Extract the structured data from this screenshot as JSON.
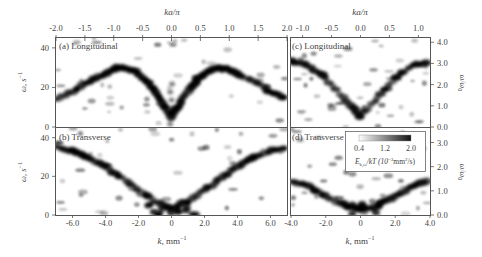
{
  "chart_data": [
    {
      "id": "a",
      "type": "heatmap",
      "title": "(a) Longitudinal",
      "xlabel": "k, mm^-1",
      "x2label": "ka/π",
      "ylabel": "ω, s^-1",
      "xlim": [
        -7.0,
        7.0
      ],
      "x2lim": [
        -2.0,
        2.0
      ],
      "ylim": [
        0,
        45
      ],
      "x2ticks": [
        "-2.0",
        "-1.5",
        "-1.0",
        "-0.5",
        "0.0",
        "0.5",
        "1.0",
        "1.5",
        "2.0"
      ],
      "yticks": [
        "0",
        "20",
        "40"
      ],
      "ridge": {
        "x": [
          -7.0,
          -6.0,
          -5.0,
          -4.0,
          -3.5,
          -3.0,
          -2.5,
          -2.0,
          -1.5,
          -1.0,
          -0.5,
          0.0,
          0.5,
          1.0,
          1.5,
          2.0,
          2.5,
          3.0,
          3.5,
          4.0,
          5.0,
          6.0,
          7.0
        ],
        "y": [
          14,
          18,
          23,
          27,
          29,
          30,
          29,
          27,
          23,
          18,
          12,
          5,
          12,
          18,
          23,
          27,
          29,
          30,
          29,
          27,
          23,
          18,
          14
        ]
      }
    },
    {
      "id": "b",
      "type": "heatmap",
      "title": "(b) Transverse",
      "xlabel": "k, mm^-1",
      "ylabel": "ω, s^-1",
      "xlim": [
        -7.0,
        7.0
      ],
      "ylim": [
        0,
        45
      ],
      "xticks": [
        "-6.0",
        "-4.0",
        "-2.0",
        "0",
        "2.0",
        "4.0",
        "6.0"
      ],
      "yticks": [
        "0",
        "20",
        "40"
      ],
      "ridge": {
        "x": [
          -7.0,
          -6.0,
          -5.0,
          -4.0,
          -3.0,
          -2.0,
          -1.0,
          0.0,
          1.0,
          2.0,
          3.0,
          4.0,
          5.0,
          6.0,
          7.0
        ],
        "y": [
          35,
          33,
          30,
          25,
          19,
          13,
          7,
          3,
          7,
          13,
          19,
          25,
          30,
          33,
          35
        ]
      }
    },
    {
      "id": "c",
      "type": "heatmap",
      "title": "(c) Longitudinal",
      "x2label": "ka/π",
      "y2label": "ω/ω0",
      "xlim": [
        -4.0,
        4.0
      ],
      "x2lim": [
        -1.2,
        1.2
      ],
      "y2lim": [
        0.0,
        4.2
      ],
      "x2ticks": [
        "-1.0",
        "-0.5",
        "0.0",
        "0.5",
        "1.0"
      ],
      "y2ticks": [
        "0.0",
        "1.0",
        "2.0",
        "3.0",
        "4.0"
      ],
      "ridge": {
        "x": [
          -4.0,
          -3.0,
          -2.0,
          -1.0,
          0.0,
          1.0,
          2.0,
          3.0,
          4.0
        ],
        "y": [
          3.1,
          2.9,
          2.3,
          1.4,
          0.5,
          1.4,
          2.3,
          2.9,
          3.1
        ]
      }
    },
    {
      "id": "d",
      "type": "heatmap",
      "title": "(d) Transverse",
      "xlabel": "k, mm^-1",
      "y2label": "ω/ω0",
      "xlim": [
        -4.0,
        4.0
      ],
      "y2lim": [
        0.0,
        3.6
      ],
      "xticks": [
        "-4.0",
        "-2.0",
        "0",
        "2.0",
        "4.0"
      ],
      "y2ticks": [
        "0.0",
        "1.0",
        "2.0",
        "3.0"
      ],
      "ridge": {
        "x": [
          -4.0,
          -3.0,
          -2.0,
          -1.0,
          0.0,
          1.0,
          2.0,
          3.0,
          4.0
        ],
        "y": [
          1.4,
          1.2,
          0.8,
          0.4,
          0.2,
          0.4,
          0.8,
          1.2,
          1.4
        ]
      }
    }
  ],
  "colorbar": {
    "ticks": [
      "0.4",
      "1.2",
      "2.0"
    ],
    "label": "E_k,ω/kT (10^-3 mm^2/s)",
    "label_main": "E",
    "label_sub": "k,ω",
    "label_rest": "/kT (10",
    "label_exp": "−3",
    "label_tail": "mm",
    "label_exp2": "2",
    "label_end": "/s)",
    "colormap": [
      "#ffffff",
      "#1a1a1a"
    ]
  },
  "labels": {
    "top_axis": "ka/π",
    "bottom_axis_k": "k",
    "bottom_axis_unit": ", mm",
    "bottom_axis_exp": "−1",
    "left_axis_omega": "ω, s",
    "left_axis_exp": "−1",
    "right_axis": "ω/ω",
    "right_axis_sub": "0",
    "panel_a": "(a) Longitudinal",
    "panel_b": "(b) Transverse",
    "panel_c": "(c) Longitudinal",
    "panel_d": "(d) Transverse"
  },
  "colors": {
    "axis": "#555555",
    "data": "#111111",
    "background": "#ffffff"
  }
}
